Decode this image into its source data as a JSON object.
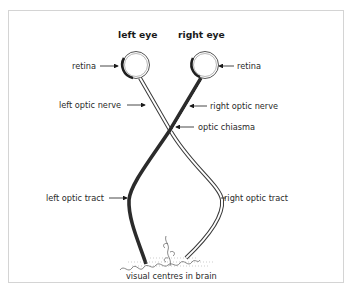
{
  "diagram": {
    "title_left": "left eye",
    "title_right": "right eye",
    "labels": {
      "retina_left": "retina",
      "retina_right": "retina",
      "left_optic_nerve": "left optic nerve",
      "right_optic_nerve": "right optic nerve",
      "optic_chiasma": "optic chiasma",
      "left_optic_tract": "left optic tract",
      "right_optic_tract": "right optic tract",
      "visual_centres": "visual centres in brain"
    },
    "colors": {
      "dark_pathway": "#2b2b2b",
      "light_pathway_outline": "#3a3a3a",
      "frame": "#d4d4d4"
    }
  }
}
